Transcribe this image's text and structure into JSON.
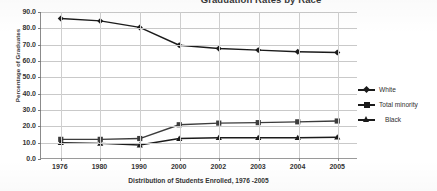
{
  "chart_data": {
    "type": "line",
    "title": "Graduation Rates by Race",
    "xlabel": "Distribution of Students Enrolled, 1976 -2005",
    "ylabel": "Percentage of Graduates",
    "categories": [
      "1976",
      "1980",
      "1990",
      "2000",
      "2002",
      "2003",
      "2004",
      "2005"
    ],
    "ylim": [
      0.0,
      90.0
    ],
    "ytick_labels": [
      "0.0",
      "10.0",
      "20.0",
      "30.0",
      "40.0",
      "50.0",
      "60.0",
      "70.0",
      "80.0",
      "90.0"
    ],
    "ytick_values": [
      0.0,
      10.0,
      20.0,
      30.0,
      40.0,
      50.0,
      60.0,
      70.0,
      80.0,
      90.0
    ],
    "grid": true,
    "legend_position": "right",
    "series": [
      {
        "name": "White",
        "marker": "diamond",
        "color": "#1b1b1b",
        "values": [
          86.0,
          84.5,
          80.5,
          69.5,
          67.5,
          66.5,
          65.5,
          65.0
        ]
      },
      {
        "name": "Total minority",
        "marker": "square",
        "color": "#3c3c3c",
        "values": [
          11.5,
          11.5,
          12.0,
          20.5,
          21.5,
          21.8,
          22.3,
          22.8
        ]
      },
      {
        "name": "Black",
        "marker": "triangle",
        "color": "#1b1b1b",
        "values": [
          9.5,
          9.0,
          8.0,
          12.0,
          12.5,
          12.5,
          12.5,
          12.8
        ]
      }
    ]
  },
  "legend": {
    "items": [
      {
        "label": "White",
        "marker": "diamond"
      },
      {
        "label": "Total minority",
        "marker": "square"
      },
      {
        "label": "Black",
        "marker": "triangle"
      }
    ]
  }
}
